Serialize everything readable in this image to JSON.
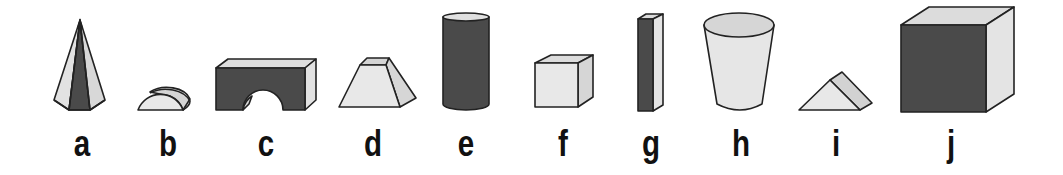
{
  "figure": {
    "colors": {
      "dark_face": "#4a4a4a",
      "light_face": "#e6e6e6",
      "mid_face": "#d0d0d0",
      "outline": "#222222",
      "label": "#111111",
      "background": "#ffffff"
    },
    "shapes": [
      {
        "label": "a",
        "shape": "hexagonal pyramid",
        "label_x": 82
      },
      {
        "label": "b",
        "shape": "half cylinder",
        "label_x": 168
      },
      {
        "label": "c",
        "shape": "rectangular block with arch",
        "label_x": 266
      },
      {
        "label": "d",
        "shape": "truncated wedge / frustum",
        "label_x": 373
      },
      {
        "label": "e",
        "shape": "cylinder",
        "label_x": 466
      },
      {
        "label": "f",
        "shape": "cube",
        "label_x": 563
      },
      {
        "label": "g",
        "shape": "tall rectangular prism",
        "label_x": 651
      },
      {
        "label": "h",
        "shape": "cup / truncated cone",
        "label_x": 741
      },
      {
        "label": "i",
        "shape": "triangular prism",
        "label_x": 836
      },
      {
        "label": "j",
        "shape": "large cube",
        "label_x": 951
      }
    ]
  }
}
